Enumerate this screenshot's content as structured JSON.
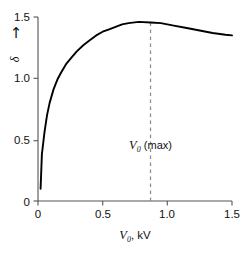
{
  "chart_data": {
    "type": "line",
    "title": "",
    "xlabel": "V0, kV",
    "ylabel": "δ",
    "xlim": [
      0,
      1.5
    ],
    "ylim": [
      0,
      1.5
    ],
    "grid": false,
    "legend": null,
    "x_ticks": [
      "0",
      "0.5",
      "1.0",
      "1.5"
    ],
    "x_tick_values": [
      0,
      0.5,
      1.0,
      1.5
    ],
    "y_ticks": [
      "0",
      "0.5",
      "1.0",
      "1.5"
    ],
    "y_tick_values": [
      0,
      0.5,
      1.0,
      1.5
    ],
    "series": [
      {
        "name": "secondary-emission-yield",
        "color": "#000000",
        "x": [
          0.02,
          0.03,
          0.05,
          0.07,
          0.09,
          0.12,
          0.15,
          0.18,
          0.22,
          0.26,
          0.3,
          0.35,
          0.4,
          0.45,
          0.5,
          0.55,
          0.6,
          0.65,
          0.7,
          0.78,
          0.87,
          0.95,
          1.05,
          1.15,
          1.25,
          1.35,
          1.45,
          1.5
        ],
        "y": [
          0.1,
          0.38,
          0.56,
          0.7,
          0.8,
          0.91,
          0.99,
          1.05,
          1.12,
          1.17,
          1.22,
          1.27,
          1.31,
          1.35,
          1.38,
          1.4,
          1.42,
          1.44,
          1.45,
          1.46,
          1.455,
          1.45,
          1.43,
          1.41,
          1.39,
          1.37,
          1.355,
          1.35
        ]
      }
    ],
    "annotations": [
      {
        "name": "v0-max-marker",
        "type": "vertical-dashed-line",
        "x": 0.87,
        "label_v": "V",
        "label_sub": "0",
        "label_rest": " (max)",
        "color": "#888888"
      }
    ],
    "axis_color": "#555555",
    "curve_color": "#000000",
    "background": "#ffffff"
  },
  "axes": {
    "y_title_symbol": "δ",
    "y_arrow": "↑",
    "x_title_v": "V",
    "x_title_sub": "0",
    "x_title_rest": ", kV"
  }
}
